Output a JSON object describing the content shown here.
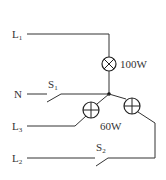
{
  "diagram": {
    "type": "circuit",
    "lines": [
      {
        "id": "L1",
        "label": "L",
        "sub": "1"
      },
      {
        "id": "N",
        "label": "N",
        "sub": ""
      },
      {
        "id": "L3",
        "label": "L",
        "sub": "3"
      },
      {
        "id": "L2",
        "label": "L",
        "sub": "2"
      }
    ],
    "switches": [
      {
        "id": "S1",
        "label": "S",
        "sub": "1"
      },
      {
        "id": "S2",
        "label": "S",
        "sub": "2"
      }
    ],
    "lamps": [
      {
        "id": "lamp-100w",
        "rating": "100W",
        "symbol": "cross"
      },
      {
        "id": "lamp-60w-left",
        "rating": "",
        "symbol": "plus"
      },
      {
        "id": "lamp-60w-right",
        "rating": "",
        "symbol": "plus"
      }
    ],
    "shared_label": "60W",
    "colors": {
      "wire": "#333333",
      "background": "#ffffff"
    }
  }
}
